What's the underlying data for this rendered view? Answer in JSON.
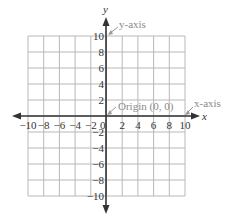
{
  "diagram": {
    "type": "cartesian-coordinate-plane",
    "x_axis_label": "x",
    "y_axis_label": "y",
    "x_ticks": [
      "−10",
      "−8",
      "−6",
      "−4",
      "−2",
      "0",
      "2",
      "4",
      "6",
      "8",
      "10"
    ],
    "y_ticks_positive": [
      "2",
      "4",
      "6",
      "8",
      "10"
    ],
    "y_ticks_negative": [
      "−2",
      "−4",
      "−6",
      "−8",
      "−10"
    ],
    "range": {
      "xmin": -10,
      "xmax": 10,
      "ymin": -10,
      "ymax": 10
    },
    "grid_step": 2,
    "annotations": {
      "y_axis": "y-axis",
      "x_axis": "x-axis",
      "origin": "Origin (0, 0)"
    },
    "colors": {
      "grid": "#b8b8b8",
      "axis": "#333333",
      "annotation": "#8a8a8a",
      "pointer": "#999999"
    }
  }
}
